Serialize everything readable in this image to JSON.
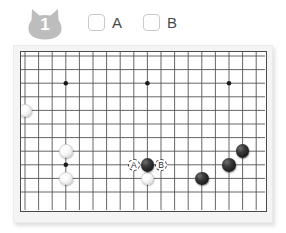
{
  "header": {
    "badge": {
      "icon": "cat-head-badge",
      "number": "1",
      "color": "#bdbdbd"
    },
    "choices": [
      {
        "id": "a",
        "label": "A",
        "checked": false
      },
      {
        "id": "b",
        "label": "B",
        "checked": false
      }
    ]
  },
  "board": {
    "type": "go-board",
    "cols": 18,
    "rows": 11,
    "cell": 13.6,
    "origin_x": 4,
    "origin_y": 4,
    "line_color": "#555555",
    "border_color": "#4a4a4a",
    "frame_color": "#f4f4f4",
    "board_color": "#ffffff",
    "star_points": [
      {
        "col": 3,
        "row": 2
      },
      {
        "col": 9,
        "row": 2
      },
      {
        "col": 15,
        "row": 2
      },
      {
        "col": 3,
        "row": 8
      },
      {
        "col": 9,
        "row": 8
      }
    ],
    "stones": [
      {
        "color": "white",
        "col": 0,
        "row": 4
      },
      {
        "color": "white",
        "col": 3,
        "row": 7
      },
      {
        "color": "white",
        "col": 3,
        "row": 9
      },
      {
        "color": "white",
        "col": 9,
        "row": 9
      },
      {
        "color": "black",
        "col": 9,
        "row": 8
      },
      {
        "color": "black",
        "col": 13,
        "row": 9
      },
      {
        "color": "black",
        "col": 15,
        "row": 8
      },
      {
        "color": "black",
        "col": 16,
        "row": 7
      }
    ],
    "markers": [
      {
        "label": "A",
        "col": 8,
        "row": 8
      },
      {
        "label": "B",
        "col": 10,
        "row": 8
      }
    ]
  }
}
